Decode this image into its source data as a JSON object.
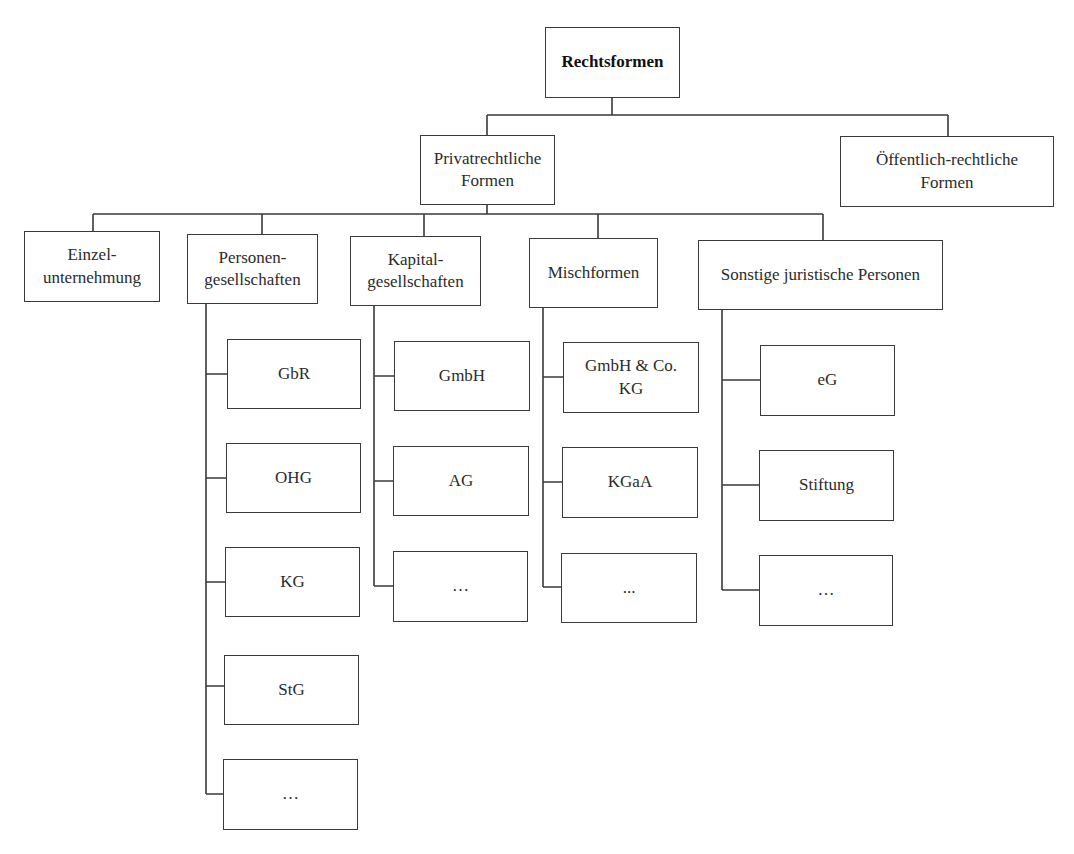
{
  "diagram": {
    "type": "org-tree",
    "root": {
      "label": "Rechtsformen"
    },
    "level1": [
      {
        "label": "Privatrechtliche\nFormen"
      },
      {
        "label": "Öffentlich-rechtliche\nFormen"
      }
    ],
    "level2": [
      {
        "label": "Einzel-\nunternehmung",
        "children": []
      },
      {
        "label": "Personen-\ngesellschaften",
        "children": [
          "GbR",
          "OHG",
          "KG",
          "StG",
          "…"
        ]
      },
      {
        "label": "Kapital-\ngesellschaften",
        "children": [
          "GmbH",
          "AG",
          "…"
        ]
      },
      {
        "label": "Mischformen",
        "children": [
          "GmbH & Co.\nKG",
          "KGaA",
          "..."
        ]
      },
      {
        "label": "Sonstige juristische Personen",
        "children": [
          "eG",
          "Stiftung",
          "…"
        ]
      }
    ]
  }
}
